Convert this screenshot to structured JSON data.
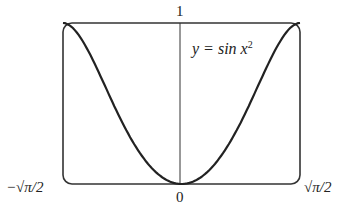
{
  "chart_data": {
    "type": "line",
    "title": "",
    "annotation": "y = sin x²",
    "xlabel": "",
    "ylabel": "",
    "x_tick_labels": [
      "−√(π/2)",
      "0",
      "√(π/2)"
    ],
    "y_tick_labels": [
      "1"
    ],
    "xlim": [
      -1.2533,
      1.2533
    ],
    "ylim": [
      0,
      1
    ],
    "grid": false,
    "series": [
      {
        "name": "y = sin x^2",
        "x": [
          -1.2533,
          -1.1,
          -1.0,
          -0.9,
          -0.8,
          -0.7,
          -0.6,
          -0.5,
          -0.4,
          -0.3,
          -0.2,
          -0.1,
          0,
          0.1,
          0.2,
          0.3,
          0.4,
          0.5,
          0.6,
          0.7,
          0.8,
          0.9,
          1.0,
          1.1,
          1.2533
        ],
        "y": [
          1.0,
          0.935,
          0.841,
          0.726,
          0.597,
          0.468,
          0.353,
          0.247,
          0.159,
          0.09,
          0.04,
          0.01,
          0,
          0.01,
          0.04,
          0.09,
          0.159,
          0.247,
          0.353,
          0.468,
          0.597,
          0.726,
          0.841,
          0.935,
          1.0
        ]
      }
    ]
  },
  "labels": {
    "y_top": "1",
    "x_left": "−√π/2",
    "x_zero": "0",
    "x_right": "√π/2",
    "equation": "y = sin x"
  }
}
